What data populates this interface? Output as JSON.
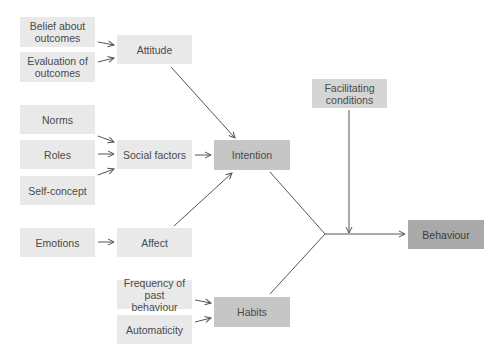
{
  "nodes": {
    "belief_about_outcomes": "Belief about outcomes",
    "evaluation_of_outcomes": "Evaluation of outcomes",
    "attitude": "Attitude",
    "norms": "Norms",
    "roles": "Roles",
    "self_concept": "Self-concept",
    "social_factors": "Social factors",
    "intention": "Intention",
    "emotions": "Emotions",
    "affect": "Affect",
    "frequency_of_past_behaviour": "Frequency of past behaviour",
    "automaticity": "Automaticity",
    "habits": "Habits",
    "facilitating_conditions": "Facilitating conditions",
    "behaviour": "Behaviour"
  },
  "edges": [
    {
      "from": "Belief about outcomes",
      "to": "Attitude"
    },
    {
      "from": "Evaluation of outcomes",
      "to": "Attitude"
    },
    {
      "from": "Norms",
      "to": "Social factors"
    },
    {
      "from": "Roles",
      "to": "Social factors"
    },
    {
      "from": "Self-concept",
      "to": "Social factors"
    },
    {
      "from": "Emotions",
      "to": "Affect"
    },
    {
      "from": "Attitude",
      "to": "Intention"
    },
    {
      "from": "Social factors",
      "to": "Intention"
    },
    {
      "from": "Affect",
      "to": "Intention"
    },
    {
      "from": "Frequency of past behaviour",
      "to": "Habits"
    },
    {
      "from": "Automaticity",
      "to": "Habits"
    },
    {
      "from": "Intention",
      "to": "Behaviour"
    },
    {
      "from": "Habits",
      "to": "Behaviour"
    },
    {
      "from": "Facilitating conditions",
      "to": "Behaviour"
    }
  ],
  "colors": {
    "input_box": "#e9e9e9",
    "facilitating_box": "#d5d5d5",
    "intermediate_box": "#c6c6c6",
    "outcome_box": "#a9a9a9",
    "line": "#555555"
  }
}
